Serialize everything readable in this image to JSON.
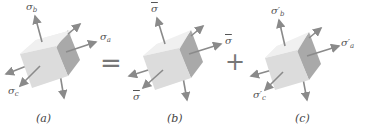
{
  "figure": {
    "panels": [
      {
        "id": "a",
        "caption": "(a)",
        "labels": {
          "top": "σ",
          "top_sub": "b",
          "right": "σ",
          "right_sub": "a",
          "left": "σ",
          "left_sub": "c"
        }
      },
      {
        "id": "b",
        "caption": "(b)",
        "labels": {
          "top": "σ",
          "right": "σ",
          "left": "σ"
        },
        "overbar": true
      },
      {
        "id": "c",
        "caption": "(c)",
        "labels": {
          "top": "σ′",
          "top_sub": "b",
          "right": "σ′",
          "right_sub": "a",
          "left": "σ′",
          "left_sub": "c"
        }
      }
    ],
    "operators": {
      "equals": "=",
      "plus": "+"
    },
    "colors": {
      "cube_front": "#dcdcdc",
      "cube_top": "#ececec",
      "cube_side": "#a9a9a9",
      "arrow": "#8a8a8a"
    }
  }
}
